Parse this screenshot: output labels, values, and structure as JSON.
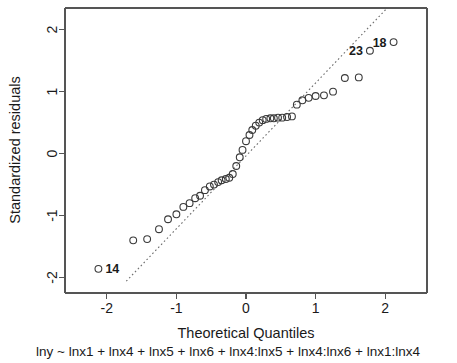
{
  "chart_data": {
    "type": "scatter",
    "title": "",
    "subtitle": "lny ~ lnx1 + lnx4 + lnx5 + lnx6 + lnx4:lnx5 + lnx4:lnx6 + lnx1:lnx4",
    "xlabel": "Theoretical Quantiles",
    "ylabel": "Standardized residuals",
    "xlim": [
      -2.6,
      2.6
    ],
    "ylim": [
      -2.25,
      2.35
    ],
    "xticks": [
      -2,
      -1,
      0,
      1,
      2
    ],
    "xticklabels": [
      "-2",
      "-1",
      "0",
      "1",
      "2"
    ],
    "yticks": [
      -2,
      -1,
      0,
      1,
      2
    ],
    "yticklabels": [
      "-2",
      "-1",
      "0",
      "1",
      "2"
    ],
    "grid": false,
    "legend": null,
    "marker": "open-circle",
    "reference_line": {
      "style": "dotted",
      "x": [
        -1.72,
        2.02
      ],
      "y": [
        -2.06,
        2.34
      ]
    },
    "x": [
      -2.12,
      -1.62,
      -1.42,
      -1.25,
      -1.12,
      -1.0,
      -0.9,
      -0.81,
      -0.73,
      -0.66,
      -0.59,
      -0.52,
      -0.46,
      -0.4,
      -0.35,
      -0.29,
      -0.24,
      -0.19,
      -0.14,
      -0.09,
      -0.05,
      0.0,
      0.05,
      0.09,
      0.14,
      0.19,
      0.24,
      0.29,
      0.35,
      0.4,
      0.46,
      0.52,
      0.59,
      0.66,
      0.73,
      0.81,
      0.9,
      1.0,
      1.12,
      1.25,
      1.42,
      1.62,
      1.78,
      2.12
    ],
    "y": [
      -1.86,
      -1.4,
      -1.38,
      -1.22,
      -1.06,
      -0.98,
      -0.86,
      -0.8,
      -0.72,
      -0.68,
      -0.59,
      -0.53,
      -0.5,
      -0.46,
      -0.43,
      -0.41,
      -0.39,
      -0.33,
      -0.2,
      -0.06,
      0.06,
      0.2,
      0.3,
      0.38,
      0.45,
      0.5,
      0.54,
      0.56,
      0.57,
      0.57,
      0.58,
      0.58,
      0.59,
      0.6,
      0.79,
      0.86,
      0.9,
      0.93,
      0.94,
      1.0,
      1.22,
      1.23,
      1.66,
      1.8
    ],
    "point_labels": [
      {
        "label": "14",
        "x": -2.12,
        "y": -1.86,
        "anchor": "right"
      },
      {
        "label": "23",
        "x": 1.78,
        "y": 1.66,
        "anchor": "left"
      },
      {
        "label": "18",
        "x": 2.12,
        "y": 1.8,
        "anchor": "left"
      }
    ]
  }
}
